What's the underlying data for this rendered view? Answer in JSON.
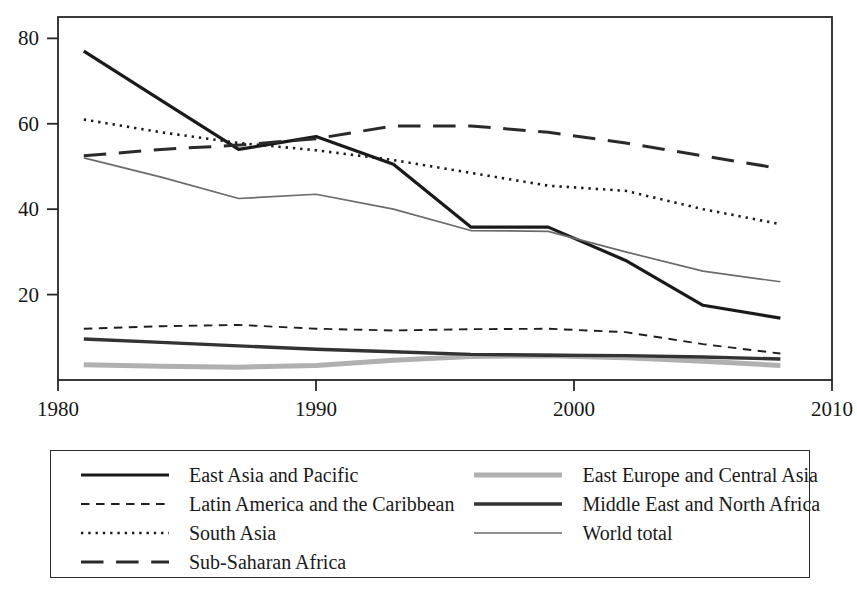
{
  "chart_data": {
    "type": "line",
    "title": "",
    "subtitle": "",
    "xlabel": "",
    "ylabel": "",
    "xlim": [
      1980,
      2010
    ],
    "ylim": [
      0,
      85
    ],
    "xticks": [
      1980,
      1990,
      2000,
      2010
    ],
    "xtick_labels": [
      "1980",
      "1990",
      "2000",
      "2010"
    ],
    "yticks": [
      20,
      40,
      60,
      80
    ],
    "ytick_labels": [
      "20",
      "40",
      "60",
      "80"
    ],
    "grid": false,
    "legend_position": "below-plot",
    "legend_columns": 2,
    "series": [
      {
        "name": "East Asia and Pacific",
        "style": "solid",
        "color": "#1a1a1a",
        "width": 3.2,
        "x": [
          1981,
          1984,
          1987,
          1990,
          1993,
          1996,
          1999,
          2002,
          2005,
          2008
        ],
        "values": [
          77.0,
          65.5,
          54.0,
          57.0,
          50.5,
          35.8,
          35.8,
          28.0,
          17.5,
          14.5
        ]
      },
      {
        "name": "Latin America and the Caribbean",
        "style": "dashed",
        "color": "#1f1f1f",
        "width": 1.9,
        "x": [
          1981,
          1984,
          1987,
          1990,
          1993,
          1996,
          1999,
          2002,
          2005,
          2008
        ],
        "values": [
          12.0,
          12.6,
          12.9,
          12.0,
          11.6,
          11.9,
          12.0,
          11.2,
          8.4,
          6.2
        ]
      },
      {
        "name": "South Asia",
        "style": "dotted",
        "color": "#1a1a1a",
        "width": 2.6,
        "x": [
          1981,
          1984,
          1987,
          1990,
          1993,
          1996,
          1999,
          2002,
          2005,
          2008
        ],
        "values": [
          61.0,
          58.0,
          55.5,
          53.8,
          51.5,
          48.5,
          45.5,
          44.3,
          40.0,
          36.5
        ]
      },
      {
        "name": "Sub-Saharan Africa",
        "style": "longdash",
        "color": "#2a2a2a",
        "width": 3.0,
        "x": [
          1981,
          1984,
          1987,
          1990,
          1993,
          1996,
          1999,
          2002,
          2005,
          2008
        ],
        "values": [
          52.5,
          54.0,
          55.0,
          56.5,
          59.5,
          59.5,
          58.0,
          55.5,
          52.5,
          49.5
        ]
      },
      {
        "name": "East Europe and Central Asia",
        "style": "solid",
        "color": "#b0b0b0",
        "width": 5.0,
        "x": [
          1981,
          1984,
          1987,
          1990,
          1993,
          1996,
          1999,
          2002,
          2005,
          2008
        ],
        "values": [
          3.6,
          3.2,
          3.0,
          3.4,
          4.6,
          5.5,
          5.7,
          5.2,
          4.4,
          3.4
        ]
      },
      {
        "name": "Middle East and North Africa",
        "style": "solid",
        "color": "#333333",
        "width": 3.4,
        "x": [
          1981,
          1984,
          1987,
          1990,
          1993,
          1996,
          1999,
          2002,
          2005,
          2008
        ],
        "values": [
          9.6,
          8.8,
          8.0,
          7.2,
          6.6,
          6.0,
          5.8,
          5.7,
          5.4,
          4.9
        ]
      },
      {
        "name": "World total",
        "style": "solid",
        "color": "#6b6b6b",
        "width": 1.7,
        "x": [
          1981,
          1984,
          1987,
          1990,
          1993,
          1996,
          1999,
          2002,
          2005,
          2008
        ],
        "values": [
          52.0,
          47.5,
          42.5,
          43.5,
          40.0,
          35.0,
          34.8,
          30.0,
          25.5,
          23.0
        ]
      }
    ]
  },
  "legend": {
    "column_left": [
      {
        "label": "East Asia and Pacific",
        "series_index": 0
      },
      {
        "label": "Latin America and the Caribbean",
        "series_index": 1
      },
      {
        "label": "South Asia",
        "series_index": 2
      },
      {
        "label": "Sub-Saharan Africa",
        "series_index": 3
      }
    ],
    "column_right": [
      {
        "label": "East Europe and Central Asia",
        "series_index": 4
      },
      {
        "label": "Middle East and North Africa",
        "series_index": 5
      },
      {
        "label": "World total",
        "series_index": 6
      }
    ]
  },
  "axes": {
    "frame_color": "#262626",
    "tick_color": "#262626"
  }
}
